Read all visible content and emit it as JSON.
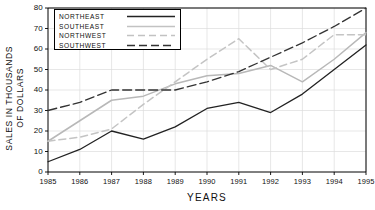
{
  "chart_data": {
    "type": "line",
    "title": "",
    "xlabel": "YEARS",
    "ylabel": "SALES IN THOUSANDS OF DOLLARS",
    "ylabel_line1": "SALES IN THOUSANDS",
    "ylabel_line2": "OF DOLLARS",
    "x": [
      1985,
      1986,
      1987,
      1988,
      1989,
      1990,
      1991,
      1992,
      1993,
      1994,
      1995
    ],
    "categories": [
      "1985",
      "1986",
      "1987",
      "1988",
      "1989",
      "1990",
      "1991",
      "1992",
      "1993",
      "1994",
      "1995"
    ],
    "xlim": [
      1985,
      1995
    ],
    "ylim": [
      0,
      80
    ],
    "yticks": [
      0,
      10,
      20,
      30,
      40,
      50,
      60,
      70,
      80
    ],
    "ytick_labels": [
      "0",
      "10",
      "20",
      "30",
      "40",
      "50",
      "60",
      "70",
      "80"
    ],
    "grid": true,
    "legend_position": "top-left",
    "series": [
      {
        "name": "NORTHEAST",
        "color": "#222222",
        "style": "solid",
        "values": [
          5,
          11,
          20,
          16,
          22,
          31,
          34,
          29,
          38,
          50,
          62
        ]
      },
      {
        "name": "SOUTHEAST",
        "color": "#b8b8b8",
        "style": "solid",
        "values": [
          15,
          25,
          35,
          37,
          43,
          47,
          48,
          52,
          44,
          55,
          68
        ]
      },
      {
        "name": "NORTHWEST",
        "color": "#c4c4c4",
        "style": "dashed-light",
        "values": [
          15,
          17,
          21,
          33,
          44,
          55,
          65,
          50,
          55,
          67,
          67
        ]
      },
      {
        "name": "SOUTHWEST",
        "color": "#333333",
        "style": "dashed-dark",
        "values": [
          30,
          34,
          40,
          40,
          40,
          44,
          49,
          56,
          63,
          71,
          80
        ]
      }
    ]
  },
  "legend": {
    "items": [
      {
        "label": "NORTHEAST"
      },
      {
        "label": "SOUTHEAST"
      },
      {
        "label": "NORTHWEST"
      },
      {
        "label": "SOUTHWEST"
      }
    ]
  }
}
